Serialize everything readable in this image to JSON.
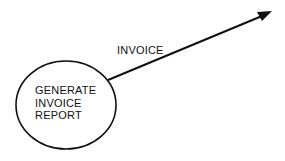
{
  "diagram": {
    "type": "data-flow",
    "process": {
      "shape": "ellipse",
      "lines": [
        "GENERATE",
        "INVOICE",
        "REPORT"
      ]
    },
    "flow": {
      "label": "INVOICE",
      "direction": "outgoing",
      "arrowhead": "filled-triangle"
    },
    "colors": {
      "stroke": "#111111",
      "background": "#ffffff"
    }
  }
}
